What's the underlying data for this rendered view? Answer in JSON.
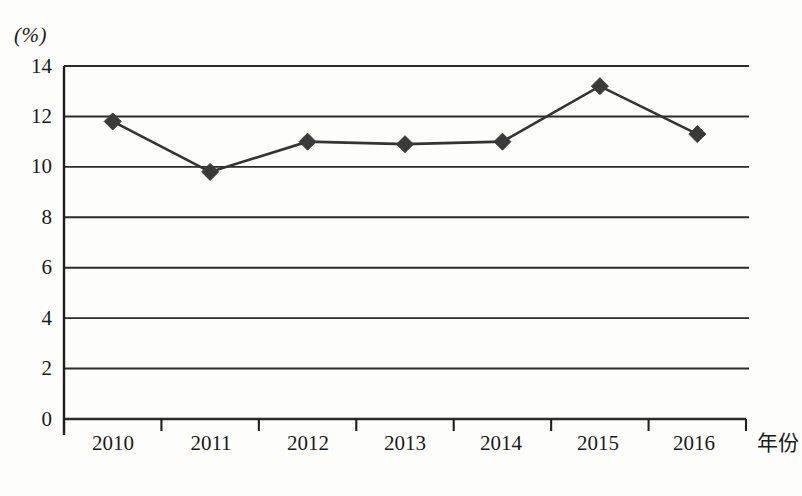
{
  "chart_data": {
    "type": "line",
    "title": "",
    "subtitle": "",
    "xlabel": "年份",
    "ylabel": "(%)",
    "categories": [
      "2010",
      "2011",
      "2012",
      "2013",
      "2014",
      "2015",
      "2016"
    ],
    "values": [
      11.8,
      9.8,
      11.0,
      10.9,
      11.0,
      13.2,
      11.3
    ],
    "series": [
      {
        "name": "",
        "values": [
          11.8,
          9.8,
          11.0,
          10.9,
          11.0,
          13.2,
          11.3
        ]
      }
    ],
    "ylim": [
      0,
      14
    ],
    "yticks": [
      0,
      2,
      4,
      6,
      8,
      10,
      12,
      14
    ],
    "ytick_labels": [
      "0",
      "2",
      "4",
      "6",
      "8",
      "10",
      "12",
      "14"
    ],
    "xtick_labels": [
      "2010",
      "2011",
      "2012",
      "2013",
      "2014",
      "2015",
      "2016"
    ],
    "grid": true,
    "grid_axis": "y",
    "legend": false,
    "legend_position": "none",
    "marker": "diamond",
    "line_color": "#333333",
    "marker_color": "#3a3a3a",
    "grid_color": "#2b2b2b",
    "axis_color": "#1f1f1f",
    "background_color": "#fdfdfc",
    "annotations": []
  },
  "axis": {
    "unit_label": "(%)",
    "x_title": "年份"
  }
}
